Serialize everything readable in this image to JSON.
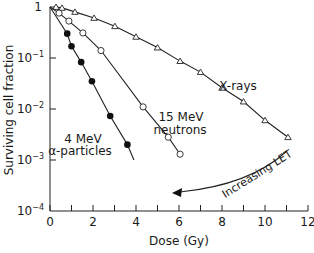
{
  "chart_data": {
    "type": "line",
    "title": "",
    "xlabel": "Dose (Gy)",
    "ylabel": "Surviving cell fraction",
    "xlim": [
      0,
      12
    ],
    "ylim": [
      0.0001,
      1
    ],
    "yscale": "log",
    "grid": false,
    "xticks": [
      0,
      2,
      4,
      6,
      8,
      10,
      12
    ],
    "xtick_labels": [
      "0",
      "2",
      "4",
      "6",
      "8",
      "10",
      "12"
    ],
    "xminor_ticks": [
      1,
      3,
      5,
      7,
      9,
      11
    ],
    "yticks": [
      1,
      0.1,
      0.01,
      0.001,
      0.0001
    ],
    "ytick_labels": [
      {
        "base": "1",
        "exp": ""
      },
      {
        "base": "10",
        "exp": "−1"
      },
      {
        "base": "10",
        "exp": "−2"
      },
      {
        "base": "10",
        "exp": "−3"
      },
      {
        "base": "10",
        "exp": "−4"
      }
    ],
    "series": [
      {
        "name": "X-rays",
        "marker": "open-triangle",
        "label": [
          "X-rays"
        ],
        "x": [
          0,
          0.28,
          0.56,
          1.16,
          2.05,
          3.02,
          4.0,
          5.0,
          6.05,
          7.0,
          8.0,
          9.0,
          10.0,
          11.07
        ],
        "y": [
          1,
          1.0,
          0.96,
          0.8,
          0.61,
          0.42,
          0.26,
          0.16,
          0.087,
          0.053,
          0.026,
          0.014,
          0.006,
          0.0028
        ]
      },
      {
        "name": "15 MeV neutrons",
        "marker": "open-circle",
        "label": [
          "15 MeV",
          "neutrons"
        ],
        "x": [
          0,
          0.42,
          0.88,
          1.53,
          2.37,
          4.33,
          5.5,
          6.05
        ],
        "y": [
          1,
          0.76,
          0.53,
          0.31,
          0.14,
          0.011,
          0.0028,
          0.0013
        ]
      },
      {
        "name": "4 MeV α-particles",
        "marker": "filled-circle",
        "label": [
          "4 MeV",
          "α-particles"
        ],
        "x": [
          0,
          0.8,
          1.0,
          1.45,
          1.95,
          2.8,
          3.6
        ],
        "y": [
          1,
          0.3,
          0.17,
          0.083,
          0.035,
          0.0073,
          0.002
        ],
        "line_end": {
          "x": 3.9,
          "y": 0.001
        }
      }
    ],
    "annotations": [
      {
        "text": "Increasing LET",
        "type": "curved-arrow",
        "direction": "from X-rays toward α-particles"
      }
    ]
  }
}
